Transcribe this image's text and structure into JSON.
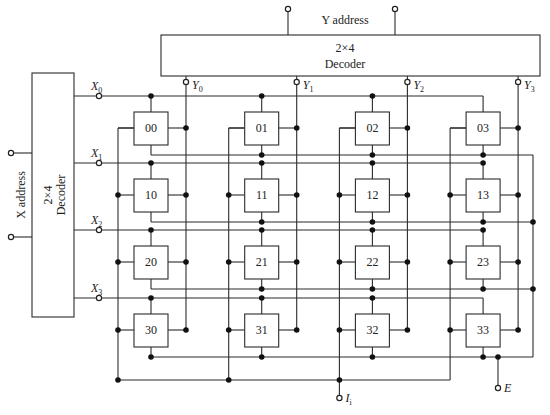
{
  "y_decoder": {
    "title_line1": "2×4",
    "title_line2": "Decoder",
    "address_label": "Y address",
    "outputs": [
      {
        "letter": "Y",
        "sub": "0"
      },
      {
        "letter": "Y",
        "sub": "1"
      },
      {
        "letter": "Y",
        "sub": "2"
      },
      {
        "letter": "Y",
        "sub": "3"
      }
    ]
  },
  "x_decoder": {
    "title_line1": "2×4",
    "title_line2": "Decoder",
    "address_label": "X address",
    "outputs": [
      {
        "letter": "X",
        "sub": "0"
      },
      {
        "letter": "X",
        "sub": "1"
      },
      {
        "letter": "X",
        "sub": "2"
      },
      {
        "letter": "X",
        "sub": "3"
      }
    ]
  },
  "cells": [
    [
      "00",
      "01",
      "02",
      "03"
    ],
    [
      "10",
      "11",
      "12",
      "13"
    ],
    [
      "20",
      "21",
      "22",
      "23"
    ],
    [
      "30",
      "31",
      "32",
      "33"
    ]
  ],
  "terminals": {
    "input": {
      "letter": "I",
      "sub": "i"
    },
    "enable": {
      "letter": "E"
    }
  },
  "colors": {
    "line": "#2b2b2b",
    "dot": "#111111",
    "background": "#ffffff"
  }
}
